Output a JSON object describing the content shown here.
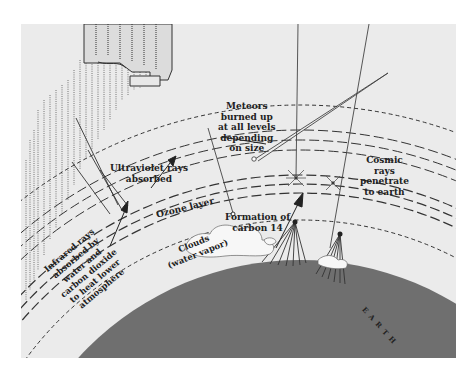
{
  "diagram": {
    "colors": {
      "background": "#ebebeb",
      "earth": "#6f6f6f",
      "lines": "#333333",
      "text": "#222222"
    },
    "labels": {
      "meteors": [
        "Meteors",
        "burned up",
        "at all levels",
        "depending",
        "on size"
      ],
      "ultraviolet": [
        "Ultraviolet rays",
        "absorbed"
      ],
      "ozone": "Ozone layer",
      "cosmic": [
        "Cosmic",
        "rays",
        "penetrate",
        "to earth"
      ],
      "carbon": [
        "Formation of",
        "carbon 14"
      ],
      "clouds": [
        "Clouds",
        "(water vapor)"
      ],
      "infrared": [
        "Infrared rays",
        "absorbed by",
        "water and",
        "carbon dioxide",
        "to heat lower",
        "atmosphere"
      ],
      "earth": "E A R T H"
    },
    "icons": {
      "sun-rays": "dotted-vertical-hatching",
      "space-station": "stylized-structure",
      "meteor": "streak",
      "cosmic-burst": "star-burst"
    }
  }
}
